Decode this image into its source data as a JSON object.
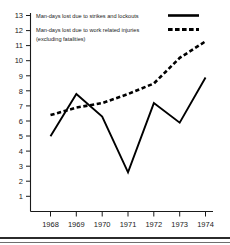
{
  "chart_data": {
    "type": "line",
    "title": "",
    "xlabel": "",
    "ylabel": "",
    "x": [
      1968,
      1969,
      1970,
      1971,
      1972,
      1973,
      1974
    ],
    "xticklabels": [
      "1968",
      "1969",
      "1970",
      "1971",
      "1972",
      "1973",
      "1974"
    ],
    "yticklabels": [
      "1",
      "2",
      "3",
      "4",
      "5",
      "6",
      "7",
      "8",
      "9",
      "10",
      "11",
      "12",
      "13"
    ],
    "ylim": [
      0,
      13
    ],
    "xlim": [
      1967.6,
      1974.4
    ],
    "grid": false,
    "legend_position": "top-left",
    "series": [
      {
        "name": "Man-days lost due to strikes and lockouts",
        "style": "solid",
        "color": "#000000",
        "values": [
          5.0,
          7.8,
          6.3,
          2.6,
          7.2,
          5.9,
          8.9
        ]
      },
      {
        "name": "Man-days lost due to work related injuries (excluding fatalities)",
        "style": "dashed",
        "color": "#000000",
        "values": [
          6.4,
          6.9,
          7.2,
          7.8,
          8.5,
          10.2,
          11.3
        ]
      }
    ]
  },
  "legend": {
    "entries": [
      {
        "label_line1": "Man-days lost due to strikes and lockouts",
        "label_line2": "",
        "style": "solid"
      },
      {
        "label_line1": "Man-days lost due to work related injuries",
        "label_line2": "(excluding fatalities)",
        "style": "dashed"
      }
    ]
  }
}
